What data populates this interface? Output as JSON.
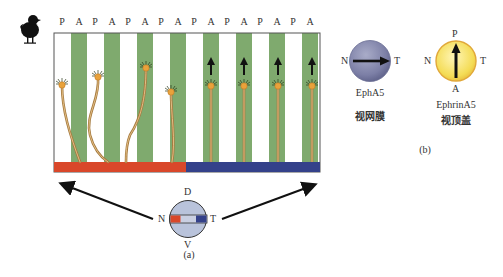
{
  "panel_a": {
    "axis_labels": [
      "P",
      "A",
      "P",
      "A",
      "P",
      "A",
      "P",
      "A",
      "P",
      "A",
      "P",
      "A",
      "P",
      "A",
      "P",
      "A"
    ],
    "organism_icon": "chick-silhouette-icon",
    "stripe_colors": {
      "A_stripe": "#7faa6e",
      "P_stripe": "#ffffff"
    },
    "bar_colors": {
      "nasal": "#d9472a",
      "temporal": "#34418a"
    },
    "neuron_color": "#e9a23b",
    "axon_color": "#a57a3f",
    "left_half": {
      "description": "nasal axons wander across stripes",
      "count": 4
    },
    "right_half": {
      "description": "temporal axons grow straight on A stripes (arrows point up)",
      "count": 4
    },
    "eye": {
      "top": "D",
      "bottom": "V",
      "left": "N",
      "right": "T"
    },
    "caption": "(a)"
  },
  "panel_b": {
    "retina": {
      "left": "N",
      "right": "T",
      "name": "EphA5",
      "label_cn": "视网膜",
      "color": "#7c7fa6",
      "arrow": "N→T"
    },
    "tectum": {
      "top": "P",
      "bottom": "A",
      "left": "N",
      "right": "T",
      "name": "EphrinA5",
      "label_cn": "视顶盖",
      "color": "#f4dc55",
      "arrow": "A→P"
    },
    "caption": "(b)"
  }
}
